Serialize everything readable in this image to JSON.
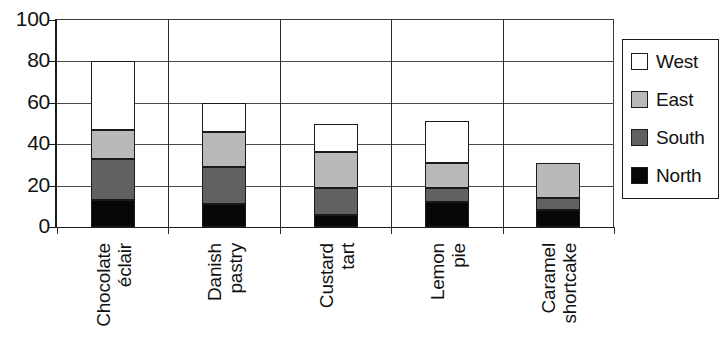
{
  "chart_data": {
    "type": "bar",
    "subtype": "stacked-vertical",
    "title": "",
    "xlabel": "",
    "ylabel": "",
    "ylim": [
      0,
      100
    ],
    "yticks": [
      0,
      20,
      40,
      60,
      80,
      100
    ],
    "grid": true,
    "legend_position": "right",
    "categories": [
      "Chocolate\néclair",
      "Danish\npastry",
      "Custard\ntart",
      "Lemon\npie",
      "Caramel\nshortcake"
    ],
    "series": [
      {
        "name": "North",
        "color": "#070707",
        "values": [
          13,
          11,
          6,
          12,
          8
        ]
      },
      {
        "name": "South",
        "color": "#616161",
        "values": [
          20,
          18,
          13,
          7,
          6
        ]
      },
      {
        "name": "East",
        "color": "#b9b9b9",
        "values": [
          14,
          17,
          17,
          12,
          17
        ]
      },
      {
        "name": "West",
        "color": "#ffffff",
        "values": [
          33,
          14,
          14,
          20,
          0
        ]
      }
    ],
    "stack_totals": [
      80,
      60,
      50,
      51,
      31
    ]
  },
  "axis": {
    "ytick_labels": [
      "100",
      "80",
      "60",
      "40",
      "20",
      "0"
    ]
  },
  "legend": {
    "entries": [
      {
        "label": "West",
        "swatch": "white-swatch"
      },
      {
        "label": "East",
        "swatch": "light-gray-swatch"
      },
      {
        "label": "South",
        "swatch": "dark-gray-swatch"
      },
      {
        "label": "North",
        "swatch": "black-swatch"
      }
    ]
  }
}
